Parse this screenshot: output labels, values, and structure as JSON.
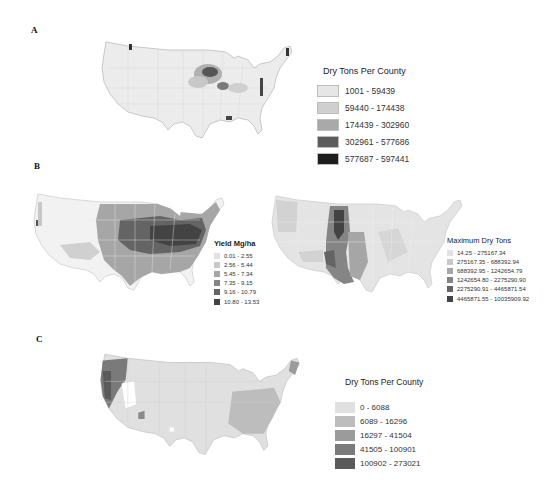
{
  "panels": [
    {
      "label": "A",
      "maps": [
        {
          "name": "dry-tons-per-county-map-a",
          "legend": {
            "title": "Dry Tons Per County",
            "items": [
              {
                "range": "1001 - 59439",
                "color": "#e6e6e6"
              },
              {
                "range": "59440 - 174438",
                "color": "#cfcfcf"
              },
              {
                "range": "174439 - 302960",
                "color": "#a9a9a9"
              },
              {
                "range": "302961 - 577686",
                "color": "#5c5c5c"
              },
              {
                "range": "577687 - 597441",
                "color": "#1e1e1e"
              }
            ]
          }
        }
      ]
    },
    {
      "label": "B",
      "maps": [
        {
          "name": "yield-map-b",
          "legend": {
            "title": "Yield  Mg/ha",
            "items": [
              {
                "range": "0.01 - 2.55",
                "color": "#e2e2e2"
              },
              {
                "range": "2.56 - 5.44",
                "color": "#c8c8c8"
              },
              {
                "range": "5.45 - 7.34",
                "color": "#a6a6a6"
              },
              {
                "range": "7.35 - 9.15",
                "color": "#858585"
              },
              {
                "range": "9.16 - 10.79",
                "color": "#646464"
              },
              {
                "range": "10.80 - 13.53",
                "color": "#434343"
              }
            ]
          }
        },
        {
          "name": "maximum-dry-tons-map-b",
          "legend": {
            "title": "Maximum Dry Tons",
            "items": [
              {
                "range": "14.25 - 275167.34",
                "color": "#e2e2e2"
              },
              {
                "range": "275167.35 - 688392.94",
                "color": "#c8c8c8"
              },
              {
                "range": "688392.95 - 1242654.79",
                "color": "#a6a6a6"
              },
              {
                "range": "1242654.80 - 2275290.90",
                "color": "#858585"
              },
              {
                "range": "2275290.91 - 4465871.54",
                "color": "#646464"
              },
              {
                "range": "4465871.55 - 10035909.92",
                "color": "#434343"
              }
            ]
          }
        }
      ]
    },
    {
      "label": "C",
      "maps": [
        {
          "name": "dry-tons-per-county-map-c",
          "legend": {
            "title": "Dry Tons Per County",
            "items": [
              {
                "range": "0 - 6088",
                "color": "#e0e0e0"
              },
              {
                "range": "6089 - 16296",
                "color": "#bdbdbd"
              },
              {
                "range": "16297 - 41504",
                "color": "#9b9b9b"
              },
              {
                "range": "41505 - 100901",
                "color": "#7a7a7a"
              },
              {
                "range": "100902 - 273021",
                "color": "#5a5a5a"
              }
            ]
          }
        }
      ]
    }
  ]
}
